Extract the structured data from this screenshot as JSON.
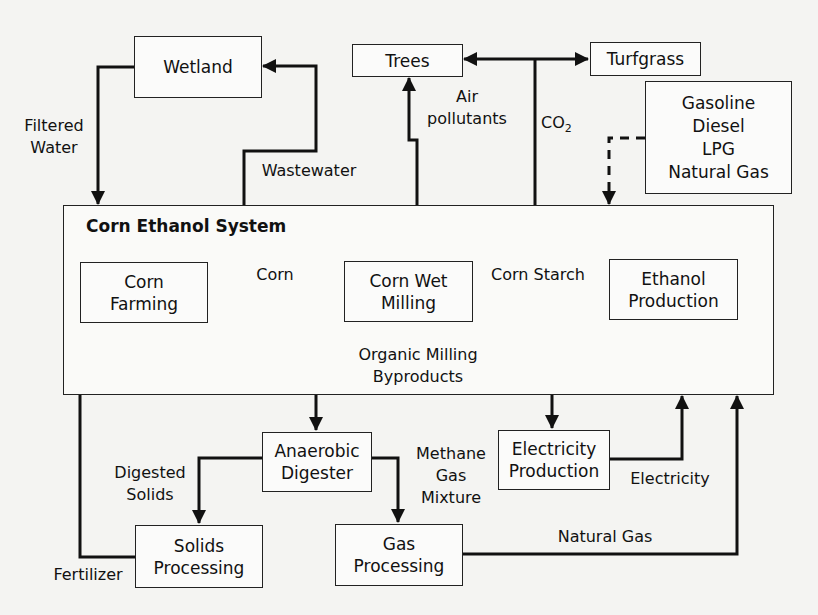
{
  "diagram": {
    "system_title": "Corn Ethanol System",
    "nodes": {
      "wetland": "Wetland",
      "trees": "Trees",
      "turfgrass": "Turfgrass",
      "fuels": "Gasoline\nDiesel\nLPG\nNatural Gas",
      "corn_farming": "Corn\nFarming",
      "corn_wet_milling": "Corn Wet\nMilling",
      "ethanol_production": "Ethanol\nProduction",
      "anaerobic_digester": "Anaerobic\nDigester",
      "electricity_production": "Electricity\nProduction",
      "solids_processing": "Solids\nProcessing",
      "gas_processing": "Gas\nProcessing"
    },
    "edges": {
      "filtered_water": "Filtered\nWater",
      "wastewater": "Wastewater",
      "air_pollutants": "Air\npollutants",
      "co2_main": "CO",
      "co2_sub": "2",
      "corn": "Corn",
      "corn_starch": "Corn Starch",
      "organic_milling_byproducts": "Organic Milling\nByproducts",
      "digested_solids": "Digested\nSolids",
      "methane_gas_mixture": "Methane\nGas\nMixture",
      "electricity": "Electricity",
      "natural_gas": "Natural Gas",
      "fertilizer": "Fertilizer"
    }
  }
}
